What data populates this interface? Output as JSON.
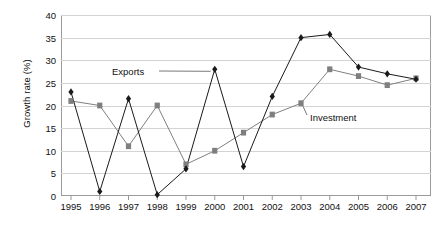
{
  "chart_data": {
    "type": "line",
    "title": "",
    "xlabel": "",
    "ylabel": "Growth rate (%)",
    "categories": [
      "1995",
      "1996",
      "1997",
      "1998",
      "1999",
      "2000",
      "2001",
      "2002",
      "2003",
      "2004",
      "2005",
      "2006",
      "2007"
    ],
    "ylim": [
      0,
      40
    ],
    "yticks": [
      0,
      5,
      10,
      15,
      20,
      25,
      30,
      35,
      40
    ],
    "grid": true,
    "legend_position": "inline-annotations",
    "series": [
      {
        "name": "Exports",
        "marker": "diamond",
        "color": "#1a1a1a",
        "values": [
          23,
          1,
          21.5,
          0.3,
          6,
          28,
          6.5,
          22,
          35,
          35.7,
          28.5,
          27,
          25.8
        ]
      },
      {
        "name": "Investment",
        "marker": "square",
        "color": "#7f7f7f",
        "values": [
          21,
          20,
          11,
          20,
          7,
          10,
          14,
          18,
          20.5,
          28,
          26.5,
          24.5,
          26
        ]
      }
    ],
    "annotations": [
      {
        "label": "Exports",
        "points_to": "2000"
      },
      {
        "label": "Investment",
        "points_to": "2003"
      }
    ]
  },
  "colors": {
    "exports": "#1a1a1a",
    "investment": "#7f7f7f",
    "grid": "#d3d3d3",
    "axis": "#9a9a9a",
    "background": "#ffffff",
    "text": "#111111"
  }
}
